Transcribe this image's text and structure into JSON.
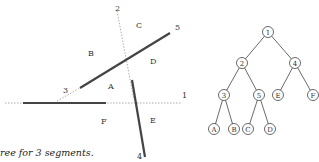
{
  "left_diagram": {
    "labels": {
      "l1": "1",
      "l2": "2",
      "l3": "3",
      "l4": "4",
      "l5": "5",
      "A": "A",
      "B": "B",
      "C": "C",
      "D": "D",
      "E": "E",
      "F": "F"
    }
  },
  "tree": {
    "nodes": {
      "n1": "1",
      "n2": "2",
      "n4": "4",
      "n3": "3",
      "n5": "5",
      "nE": "E",
      "nF": "F",
      "nA": "A",
      "nB": "B",
      "nC": "C",
      "nD": "D"
    }
  },
  "caption": "ree for 3 segments."
}
